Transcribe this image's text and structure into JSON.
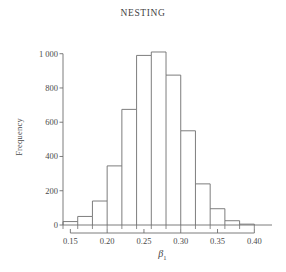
{
  "chart_data": {
    "type": "bar",
    "title": "NESTING",
    "xlabel": "β₁",
    "ylabel": "Frequency",
    "xlim": [
      0.14,
      0.405
    ],
    "ylim": [
      0,
      1080
    ],
    "grid": false,
    "legend": null,
    "bin_width": 0.02,
    "bin_edges": [
      0.14,
      0.16,
      0.18,
      0.2,
      0.22,
      0.24,
      0.26,
      0.28,
      0.3,
      0.32,
      0.34,
      0.36,
      0.38,
      0.4
    ],
    "categories": [
      "0.14-0.16",
      "0.16-0.18",
      "0.18-0.20",
      "0.20-0.22",
      "0.22-0.24",
      "0.24-0.26",
      "0.26-0.28",
      "0.28-0.30",
      "0.30-0.32",
      "0.32-0.34",
      "0.34-0.36",
      "0.36-0.38",
      "0.38-0.40"
    ],
    "values": [
      20,
      50,
      140,
      345,
      675,
      990,
      1010,
      875,
      550,
      240,
      95,
      25,
      5
    ],
    "x_ticks": [
      0.15,
      0.2,
      0.25,
      0.3,
      0.35,
      0.4
    ],
    "x_tick_labels": [
      "0.15",
      "0.20",
      "0.25",
      "0.30",
      "0.35",
      "0.40"
    ],
    "y_ticks": [
      0,
      200,
      400,
      600,
      800,
      1000
    ],
    "y_tick_labels": [
      "0",
      "200",
      "400",
      "600",
      "800",
      "1 000"
    ],
    "colors": {
      "bar_stroke": "#6e6e6e",
      "bar_fill": "#ffffff",
      "axis": "#6e6e6e",
      "text": "#3f3f3f",
      "background": "#ffffff"
    }
  }
}
